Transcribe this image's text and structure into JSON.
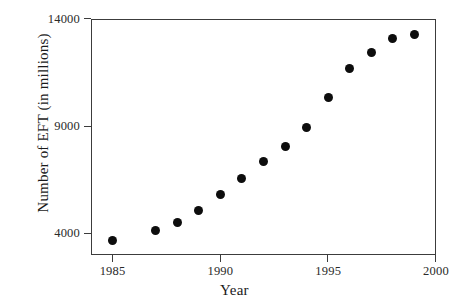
{
  "chart_data": {
    "type": "scatter",
    "title": "",
    "xlabel": "Year",
    "ylabel": "Number of EFT (in millions)",
    "xlim": [
      1984,
      2000
    ],
    "ylim": [
      3000,
      14000
    ],
    "xticks": [
      1985,
      1990,
      1995,
      2000
    ],
    "xticklabels": [
      "1985",
      "1990",
      "1995",
      "2000"
    ],
    "yticks": [
      4000,
      9000,
      14000
    ],
    "yticklabels": [
      "4000",
      "9000",
      "14000"
    ],
    "grid": false,
    "legend": null,
    "marker": "filled-circle",
    "marker_color": "#0d0d0d",
    "x": [
      1985,
      1987,
      1988,
      1989,
      1990,
      1991,
      1992,
      1993,
      1994,
      1995,
      1996,
      1997,
      1998,
      1999
    ],
    "y": [
      3670,
      4140,
      4510,
      5070,
      5810,
      6560,
      7350,
      8050,
      8930,
      10330,
      11680,
      12420,
      13070,
      13260
    ],
    "points": [
      {
        "year": 1985,
        "value": 3670
      },
      {
        "year": 1987,
        "value": 4140
      },
      {
        "year": 1988,
        "value": 4510
      },
      {
        "year": 1989,
        "value": 5070
      },
      {
        "year": 1990,
        "value": 5810
      },
      {
        "year": 1991,
        "value": 6560
      },
      {
        "year": 1992,
        "value": 7350
      },
      {
        "year": 1993,
        "value": 8050
      },
      {
        "year": 1994,
        "value": 8930
      },
      {
        "year": 1995,
        "value": 10330
      },
      {
        "year": 1996,
        "value": 11680
      },
      {
        "year": 1997,
        "value": 12420
      },
      {
        "year": 1998,
        "value": 13070
      },
      {
        "year": 1999,
        "value": 13260
      }
    ]
  },
  "axis_color": "#3c3c3c",
  "background": "#ffffff"
}
